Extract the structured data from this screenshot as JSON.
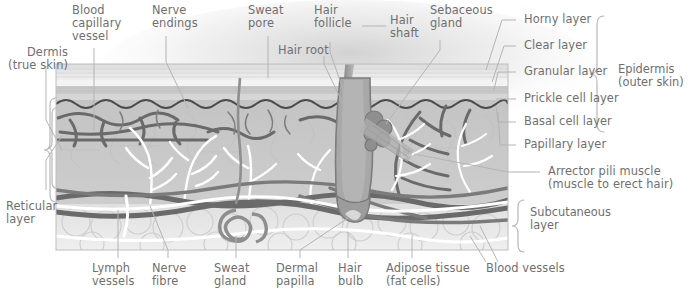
{
  "figure": {
    "palette": {
      "label_text": "#6f6f6f",
      "leader_line": "#b4b4b4",
      "bracket": "#b8b8b8",
      "horny_layer": "#e9e9e9",
      "clear_layer": "#f4f4f4",
      "granular_layer": "#cfcfcf",
      "prickle_layer": "#d9d9d9",
      "basal_line": "#4a4a4a",
      "dermis": "#c6c6c6",
      "subcutaneous": "#e4e4e4",
      "blood_vessel": "#6d6d6d",
      "nerve_fibre": "#ffffff",
      "hair": "#9a9a9a",
      "gland": "#8e8e8e",
      "background_glow": "#d8d8d8"
    }
  },
  "labels": {
    "dermis": "Dermis\n(true skin)",
    "blood_capillary_vessel": "Blood\ncapillary\nvessel",
    "nerve_endings": "Nerve\nendings",
    "sweat_pore": "Sweat\npore",
    "hair_root": "Hair root",
    "hair_follicle": "Hair\nfollicle",
    "hair_shaft": "Hair\nshaft",
    "sebaceous_gland": "Sebaceous\ngland",
    "horny_layer": "Horny layer",
    "clear_layer": "Clear layer",
    "granular_layer": "Granular layer",
    "prickle_cell_layer": "Prickle cell layer",
    "basal_cell_layer": "Basal cell layer",
    "papillary_layer": "Papillary layer",
    "epidermis": "Epidermis\n(outer skin)",
    "arrector_pili_muscle": "Arrector pili muscle\n(muscle to erect hair)",
    "subcutaneous_layer": "Subcutaneous\nlayer",
    "reticular_layer": "Reticular\nlayer",
    "lymph_vessels": "Lymph\nvessels",
    "nerve_fibre": "Nerve\nfibre",
    "sweat_gland": "Sweat\ngland",
    "dermal_papilla": "Dermal\npapilla",
    "hair_bulb": "Hair\nbulb",
    "adipose_tissue": "Adipose tissue\n(fat cells)",
    "blood_vessels": "Blood vessels"
  }
}
